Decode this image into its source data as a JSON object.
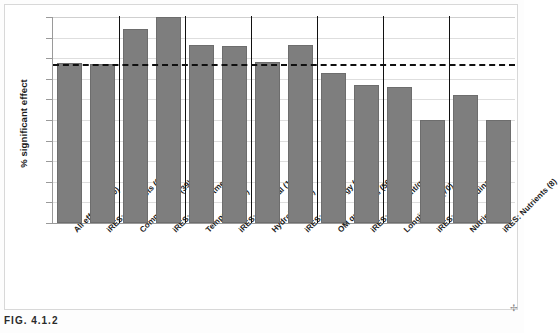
{
  "figure": {
    "caption": "FIG. 4.1.2",
    "ylabel": "% significant effect"
  },
  "colors": {
    "bar_fill": "#7e7e7e",
    "bar_stroke": "#6d6d6d",
    "gridline": "#dedede",
    "axis": "#9a9a9a",
    "threshold": "#101010",
    "separator": "#111111"
  },
  "chart_data": {
    "type": "bar",
    "title": "",
    "xlabel": "",
    "ylabel": "% significant effect",
    "ylim": [
      50,
      100
    ],
    "ytick_labels": [
      "100%",
      "95%",
      "90%",
      "85%",
      "80%",
      "75%",
      "70%",
      "65%",
      "60%",
      "55%",
      "50%"
    ],
    "ytick_values": [
      100,
      95,
      90,
      85,
      80,
      75,
      70,
      65,
      60,
      55,
      50
    ],
    "grid": true,
    "legend": "none",
    "threshold_line": {
      "value": 88.5,
      "style": "dashed",
      "label": ""
    },
    "group_separators_after": [
      2,
      4,
      6,
      8,
      10,
      12
    ],
    "categories": [
      "All effects (520)",
      "iRES: All effects (67)",
      "Compartment (39)",
      "iRES: Compartment (6)",
      "Temporal (103)",
      "iRES: Temporal (14)",
      "Hydrology (32)",
      "iRES: Hydrology (15)",
      "OM quant/qual (56)",
      "iRES: OM quant/qual (6)",
      "Longitudinal (70)",
      "iRES: Longitudinal (8)",
      "Nutrients (52)",
      "iRES: Nutrients (8)"
    ],
    "values": [
      88.8,
      88.5,
      97.0,
      100.0,
      93.2,
      93.0,
      89.0,
      93.2,
      86.5,
      83.5,
      83.0,
      75.0,
      81.0,
      75.0
    ]
  }
}
